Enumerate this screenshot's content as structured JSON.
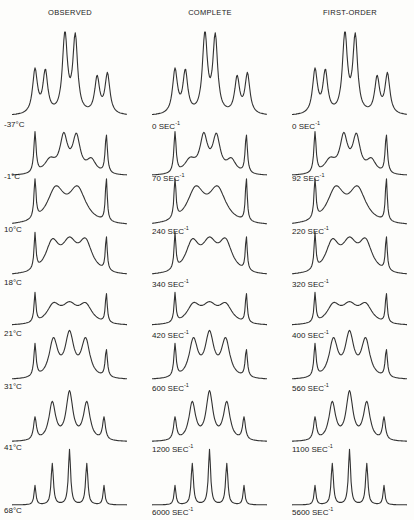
{
  "figure": {
    "columns": [
      {
        "title": "OBSERVED"
      },
      {
        "title": "COMPLETE"
      },
      {
        "title": "FIRST-ORDER"
      }
    ],
    "rows": [
      {
        "observed": "-37°C",
        "complete": "0 SEC",
        "first_order": "0 SEC"
      },
      {
        "observed": "-1°C",
        "complete": "70 SEC",
        "first_order": "92 SEC"
      },
      {
        "observed": "10°C",
        "complete": "240 SEC",
        "first_order": "220 SEC"
      },
      {
        "observed": "18°C",
        "complete": "340 SEC",
        "first_order": "320 SEC"
      },
      {
        "observed": "21°C",
        "complete": "420 SEC",
        "first_order": "400 SEC"
      },
      {
        "observed": "31°C",
        "complete": "600 SEC",
        "first_order": "560 SEC"
      },
      {
        "observed": "41°C",
        "complete": "1200 SEC",
        "first_order": "1100 SEC"
      },
      {
        "observed": "68°C",
        "complete": "6000 SEC",
        "first_order": "5600 SEC"
      }
    ],
    "rate_unit_exponent": "-1"
  }
}
